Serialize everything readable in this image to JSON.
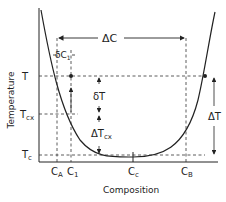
{
  "diagram": {
    "type": "phase-diagram-sketch",
    "axes": {
      "x_label": "Composition",
      "y_label": "Temperature"
    },
    "y_ticks": [
      {
        "id": "T",
        "label": "T",
        "sub": ""
      },
      {
        "id": "Tcx",
        "label": "T",
        "sub": "cx"
      },
      {
        "id": "Tc",
        "label": "T",
        "sub": "c"
      }
    ],
    "x_ticks": [
      {
        "id": "CA",
        "label": "C",
        "sub": "A"
      },
      {
        "id": "C1",
        "label": "C",
        "sub": "1"
      },
      {
        "id": "Cc",
        "label": "C",
        "sub": "c"
      },
      {
        "id": "CB",
        "label": "C",
        "sub": "B"
      }
    ],
    "annotations": {
      "delta_C": "ΔC",
      "delta_C1_sym": "δC",
      "delta_C1_sub": "1",
      "delta_T_small": "δT",
      "delta_Tcx_sym": "ΔT",
      "delta_Tcx_sub": "cx",
      "delta_T": "ΔT"
    },
    "colors": {
      "line": "#222222",
      "background": "#ffffff"
    }
  }
}
